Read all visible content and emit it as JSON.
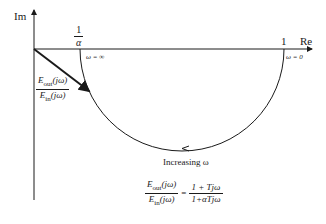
{
  "axes": {
    "imag_label": "Im",
    "real_label": "Re"
  },
  "ticks": {
    "inv_alpha_num": "1",
    "inv_alpha_den": "α",
    "one": "1"
  },
  "annotations": {
    "omega_inf": "ω = ∞",
    "omega_zero": "ω = 0",
    "increasing": "Increasing ω"
  },
  "vector_label": {
    "num_E": "E",
    "num_sub": "out",
    "num_arg": "(jω)",
    "den_E": "E",
    "den_sub": "in",
    "den_arg": "(jω)"
  },
  "equation": {
    "lhs_num_E": "E",
    "lhs_num_sub": "out",
    "lhs_num_arg": "(jω)",
    "lhs_den_E": "E",
    "lhs_den_sub": "in",
    "lhs_den_arg": "(jω)",
    "equals": "=",
    "rhs_num": "1 + Tjω",
    "rhs_den": "1+αTjω"
  }
}
